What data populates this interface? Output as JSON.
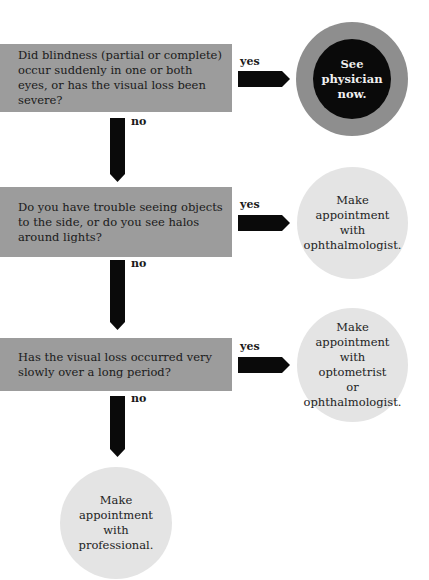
{
  "questions": [
    {
      "text": "Did blindness (partial or complete) occur suddenly in one or both eyes, or has the visual loss been severe?",
      "yes_label": "yes",
      "no_label": "no"
    },
    {
      "text": "Do you have trouble seeing objects to the side, or do you see halos around lights?",
      "yes_label": "yes",
      "no_label": "no"
    },
    {
      "text": "Has the visual loss occurred very slowly over a long period?",
      "yes_label": "yes",
      "no_label": "no"
    }
  ],
  "outcomes": [
    {
      "text": "See\nphysician\nnow.",
      "style": "urgent"
    },
    {
      "text": "Make\nappointment\nwith\nophthalmologist.",
      "style": "normal"
    },
    {
      "text": "Make\nappointment\nwith\noptometrist\nor\nophthalmologist.",
      "style": "normal"
    },
    {
      "text": "Make\nappointment\nwith\nprofessional.",
      "style": "normal"
    }
  ],
  "colors": {
    "question_box": "#9c9c9c",
    "arrow": "#0a0a0a",
    "outcome_circle": "#e4e4e4",
    "urgent_outer": "#8e8e8e",
    "urgent_inner": "#0a0a0a"
  }
}
